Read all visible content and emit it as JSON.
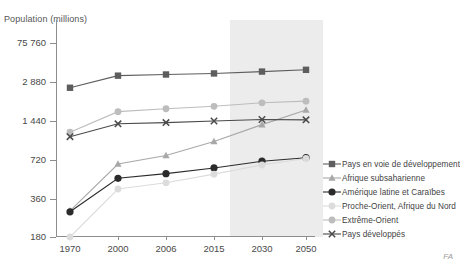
{
  "chart_data": {
    "type": "line",
    "title": "",
    "ylabel": "Population (millions)",
    "xlabel": "",
    "categories": [
      "1970",
      "2000",
      "2006",
      "2015",
      "2030",
      "2050"
    ],
    "y_ticks": [
      "180",
      "360",
      "720",
      "1 440",
      "2 880",
      "75 760"
    ],
    "y_tick_values": [
      180,
      360,
      720,
      1440,
      2880,
      75760
    ],
    "yscale": "log",
    "grid": false,
    "legend_position": "right",
    "projection_start_category": "2015",
    "projection_note": "shaded band marks projected years",
    "series": [
      {
        "name": "Pays en voie de développement",
        "marker": "square",
        "color": "#5d5d5d",
        "values": [
          2600,
          4900,
          5400,
          5900,
          6900,
          8000
        ]
      },
      {
        "name": "Afrique subsaharienne",
        "marker": "triangle",
        "color": "#a8a8a8",
        "values": [
          290,
          670,
          780,
          1000,
          1350,
          1750
        ]
      },
      {
        "name": "Amérique latine et Caraïbes",
        "marker": "circle-filled",
        "color": "#2b2b2b",
        "values": [
          285,
          520,
          565,
          625,
          705,
          750
        ]
      },
      {
        "name": "Proche-Orient, Afrique du Nord",
        "marker": "circle-light",
        "color": "#dcdcdc",
        "values": [
          180,
          430,
          480,
          560,
          660,
          740
        ]
      },
      {
        "name": "Extrême-Orient",
        "marker": "circle-gray",
        "color": "#bdbdbd",
        "values": [
          1180,
          1700,
          1790,
          1870,
          1990,
          2050
        ]
      },
      {
        "name": "Pays développés",
        "marker": "cross",
        "color": "#4a4a4a",
        "values": [
          1090,
          1370,
          1400,
          1440,
          1480,
          1470
        ]
      }
    ]
  },
  "credit": "FA"
}
